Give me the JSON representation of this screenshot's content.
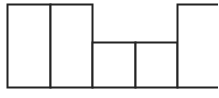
{
  "diagram": {
    "stroke_color": "#222222",
    "background": "#ffffff",
    "blocks": [
      {
        "name": "block-1",
        "x": 7,
        "y": 4,
        "w": 43,
        "h": 83
      },
      {
        "name": "block-2",
        "x": 50,
        "y": 4,
        "w": 42,
        "h": 83
      },
      {
        "name": "block-3",
        "x": 92,
        "y": 42,
        "w": 43,
        "h": 45
      },
      {
        "name": "block-4",
        "x": 135,
        "y": 42,
        "w": 42,
        "h": 45
      },
      {
        "name": "block-5",
        "x": 177,
        "y": 4,
        "w": 43,
        "h": 83
      }
    ]
  }
}
